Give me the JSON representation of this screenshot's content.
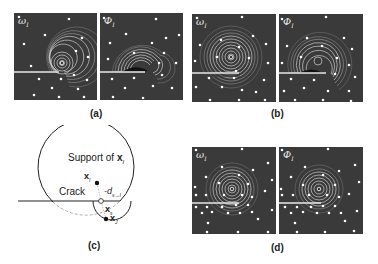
{
  "figure": {
    "panels": [
      {
        "id": "a",
        "label": "(a)",
        "left_symbol": "ω",
        "left_sub": "I",
        "right_symbol": "Φ",
        "right_sub": "I"
      },
      {
        "id": "b",
        "label": "(b)",
        "left_symbol": "ω",
        "left_sub": "I",
        "right_symbol": "Φ",
        "right_sub": "I"
      },
      {
        "id": "c",
        "label": "(c)"
      },
      {
        "id": "d",
        "label": "(d)",
        "left_symbol": "ω",
        "left_sub": "I",
        "right_symbol": "Φ",
        "right_sub": "I"
      }
    ],
    "diagram_c": {
      "support_text": "Support of",
      "support_node": "x",
      "support_sub": "I",
      "crack_text": "Crack",
      "node_i": "x",
      "node_i_sub": "I",
      "node_s": "x",
      "node_s_sub": "s",
      "node_j": "x",
      "node_j_sub": "J",
      "distance": "d",
      "distance_sub": "s→I"
    },
    "colors": {
      "panel_bg": "#3a3a3a",
      "contour": "#d8d8d8",
      "node": "#ffffff",
      "crack": "#e0e0e0"
    }
  }
}
